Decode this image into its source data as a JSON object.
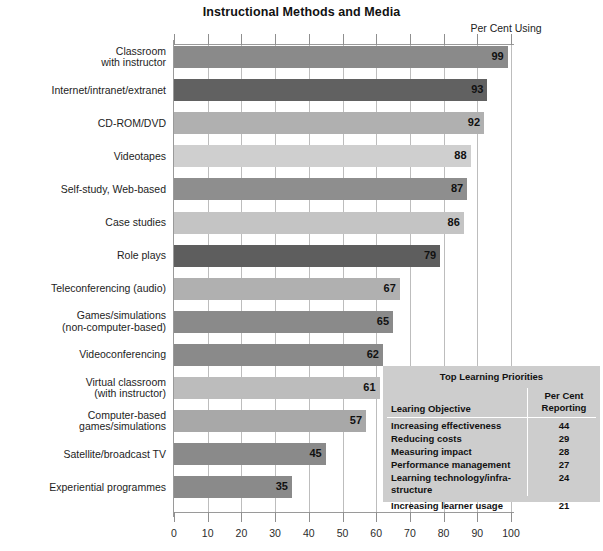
{
  "chart_data": {
    "type": "bar",
    "orientation": "horizontal",
    "title": "Instructional Methods and Media",
    "xlabel": "Per Cent Using",
    "ylabel": "",
    "xlim": [
      0,
      100
    ],
    "xticks": [
      0,
      10,
      20,
      30,
      40,
      50,
      60,
      70,
      80,
      90,
      100
    ],
    "grid": true,
    "legend": "none",
    "categories": [
      "Classroom\nwith instructor",
      "Internet/intranet/extranet",
      "CD-ROM/DVD",
      "Videotapes",
      "Self-study, Web-based",
      "Case studies",
      "Role plays",
      "Teleconferencing (audio)",
      "Games/simulations\n(non-computer-based)",
      "Videoconferencing",
      "Virtual classroom\n(with instructor)",
      "Computer-based\ngames/simulations",
      "Satellite/broadcast TV",
      "Experiential programmes"
    ],
    "values": [
      99,
      93,
      92,
      88,
      87,
      86,
      79,
      67,
      65,
      62,
      61,
      57,
      45,
      35
    ]
  },
  "bars": [
    {
      "label_line1": "Classroom",
      "label_line2": "with instructor",
      "value": 99,
      "color": "#8a8a8a"
    },
    {
      "label_line1": "Internet/intranet/extranet",
      "label_line2": "",
      "value": 93,
      "color": "#616161"
    },
    {
      "label_line1": "CD-ROM/DVD",
      "label_line2": "",
      "value": 92,
      "color": "#b0b0b0"
    },
    {
      "label_line1": "Videotapes",
      "label_line2": "",
      "value": 88,
      "color": "#cfcfcf"
    },
    {
      "label_line1": "Self-study, Web-based",
      "label_line2": "",
      "value": 87,
      "color": "#8e8e8e"
    },
    {
      "label_line1": "Case studies",
      "label_line2": "",
      "value": 86,
      "color": "#c4c4c4"
    },
    {
      "label_line1": "Role plays",
      "label_line2": "",
      "value": 79,
      "color": "#5e5e5e"
    },
    {
      "label_line1": "Teleconferencing (audio)",
      "label_line2": "",
      "value": 67,
      "color": "#b0b0b0"
    },
    {
      "label_line1": "Games/simulations",
      "label_line2": "(non-computer-based)",
      "value": 65,
      "color": "#8a8a8a"
    },
    {
      "label_line1": "Videoconferencing",
      "label_line2": "",
      "value": 62,
      "color": "#8a8a8a"
    },
    {
      "label_line1": "Virtual classroom",
      "label_line2": "(with instructor)",
      "value": 61,
      "color": "#bcbcbc"
    },
    {
      "label_line1": "Computer-based",
      "label_line2": "games/simulations",
      "value": 57,
      "color": "#a8a8a8"
    },
    {
      "label_line1": "Satellite/broadcast TV",
      "label_line2": "",
      "value": 45,
      "color": "#8a8a8a"
    },
    {
      "label_line1": "Experiential programmes",
      "label_line2": "",
      "value": 35,
      "color": "#8a8a8a"
    }
  ],
  "axis": {
    "unit_label": "Per Cent Using",
    "ticks": [
      "0",
      "10",
      "20",
      "30",
      "40",
      "50",
      "60",
      "70",
      "80",
      "90",
      "100"
    ]
  },
  "priorities_table": {
    "title": "Top Learning Priorities",
    "col_objective": "Learing Objective",
    "col_value_line1": "Per Cent",
    "col_value_line2": "Reporting",
    "rows": [
      {
        "objective": "Increasing effectiveness",
        "value": "44",
        "tall": false,
        "gap": false
      },
      {
        "objective": "Reducing costs",
        "value": "29",
        "tall": false,
        "gap": false
      },
      {
        "objective": "Measuring impact",
        "value": "28",
        "tall": false,
        "gap": false
      },
      {
        "objective": "Performance management",
        "value": "27",
        "tall": false,
        "gap": false
      },
      {
        "objective": "Learning technology/infra-structure",
        "value": "24",
        "tall": true,
        "gap": false
      },
      {
        "objective": "Increasing learner usage",
        "value": "21",
        "tall": false,
        "gap": true
      }
    ]
  },
  "colors": {
    "grid": "#bdbdbd",
    "axis": "#9a9a9a",
    "table_bg": "#cdcdcd",
    "text": "#111111"
  }
}
